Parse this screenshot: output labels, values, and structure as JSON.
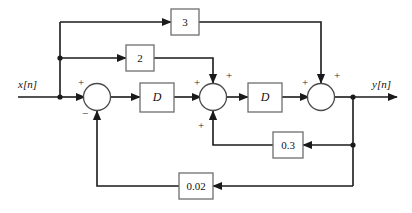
{
  "diagram": {
    "type": "signal-flow-block-diagram",
    "io": {
      "input_label": "x[n]",
      "output_label": "y[n]"
    },
    "blocks": [
      {
        "id": "gain-3",
        "label": "3",
        "kind": "gain",
        "x": 185,
        "y": 22
      },
      {
        "id": "gain-2",
        "label": "2",
        "kind": "gain",
        "x": 140,
        "y": 58
      },
      {
        "id": "delay-1",
        "label": "D",
        "kind": "delay",
        "x": 157,
        "y": 97
      },
      {
        "id": "delay-2",
        "label": "D",
        "kind": "delay",
        "x": 265,
        "y": 97
      },
      {
        "id": "gain-0p3",
        "label": "0.3",
        "kind": "gain",
        "x": 288,
        "y": 145
      },
      {
        "id": "gain-0p02",
        "label": "0.02",
        "kind": "gain",
        "x": 196,
        "y": 186
      }
    ],
    "summers": [
      {
        "id": "sum-1",
        "x": 97,
        "y": 97,
        "signs": {
          "left": "+",
          "bottom": "−"
        }
      },
      {
        "id": "sum-2",
        "x": 213,
        "y": 97,
        "signs": {
          "left": "+",
          "top": "+",
          "bottom": "+"
        }
      },
      {
        "id": "sum-3",
        "x": 321,
        "y": 97,
        "signs": {
          "left": "+",
          "top": "+"
        }
      }
    ],
    "signs": {
      "plus": "+",
      "minus": "−"
    },
    "colors": {
      "background": "#ffffff",
      "wire": "#1a1a1a",
      "block_stroke": "#6e6e6e",
      "summer_stroke": "#4a4a4a",
      "text": "#111111"
    }
  }
}
